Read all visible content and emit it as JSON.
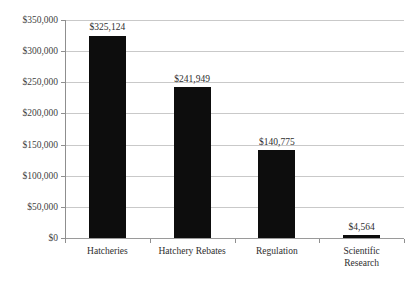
{
  "chart_data": {
    "type": "bar",
    "title": "",
    "subtitle": "",
    "xlabel": "",
    "ylabel": "",
    "categories": [
      "Hatcheries",
      "Hatchery Rebates",
      "Regulation",
      "Scientific Research"
    ],
    "values": [
      325124,
      241949,
      140775,
      4564
    ],
    "value_labels": [
      "$325,124",
      "$241,949",
      "$140,775",
      "$4,564"
    ],
    "ylim": [
      0,
      350000
    ],
    "ytick_values": [
      0,
      50000,
      100000,
      150000,
      200000,
      250000,
      300000,
      350000
    ],
    "ytick_labels": [
      "$0",
      "$50,000",
      "$100,000",
      "$150,000",
      "$200,000",
      "$250,000",
      "$300,000",
      "$350,000"
    ],
    "grid": true,
    "grid_axis": "y",
    "legend": false,
    "legend_position": "none",
    "series": [
      {
        "name": "",
        "values": [
          325124,
          241949,
          140775,
          4564
        ]
      }
    ],
    "colors": {
      "bar": "#0d0d0d",
      "gridline": "#c9c9c9",
      "axis": "#8f8f8f",
      "text": "#2e2e2e",
      "background": "#ffffff"
    }
  },
  "categories_wrapped": [
    [
      "Hatcheries"
    ],
    [
      "Hatchery Rebates"
    ],
    [
      "Regulation"
    ],
    [
      "Scientific",
      "Research"
    ]
  ]
}
